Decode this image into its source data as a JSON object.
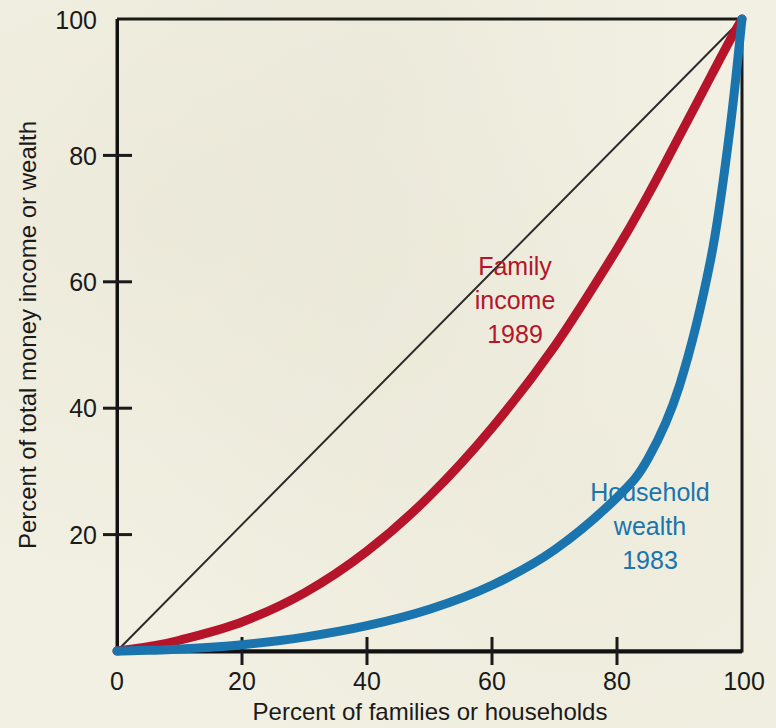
{
  "page": {
    "background_color": "#f2f0e2",
    "ink_color": "#1a1a1a"
  },
  "chart_data": {
    "type": "line",
    "title": "",
    "xlabel": "Percent of families or households",
    "ylabel": "Percent of total money income or wealth",
    "xlim": [
      0,
      100
    ],
    "ylim": [
      0,
      100
    ],
    "grid": false,
    "legend": "inline-annotations",
    "xticks": [
      "0",
      "20",
      "40",
      "60",
      "80",
      "100"
    ],
    "yticks": [
      "0",
      "20",
      "40",
      "60",
      "80",
      "100"
    ],
    "xtick_values": [
      0,
      20,
      40,
      60,
      80,
      100
    ],
    "ytick_values": [
      0,
      20,
      40,
      60,
      80,
      100
    ],
    "series": [
      {
        "name": "Line of perfect equality",
        "color": "#2b2b2b",
        "width": 2,
        "x": [
          0,
          100
        ],
        "values": [
          0,
          100
        ]
      },
      {
        "name": "Family income 1989",
        "color": "#b5142a",
        "width": 9,
        "x": [
          0,
          5,
          10,
          20,
          30,
          40,
          50,
          60,
          70,
          80,
          85,
          90,
          95,
          98,
          100
        ],
        "values": [
          0,
          0.7,
          1.7,
          4.6,
          9.2,
          15.8,
          24.5,
          35.3,
          48.2,
          63.6,
          72.2,
          81.5,
          90.9,
          96.5,
          100
        ]
      },
      {
        "name": "Household wealth 1983",
        "color": "#1a74ae",
        "width": 9,
        "x": [
          0,
          5,
          10,
          20,
          30,
          40,
          50,
          60,
          70,
          80,
          85,
          90,
          95,
          98,
          100
        ],
        "values": [
          0,
          0.1,
          0.3,
          1.0,
          2.2,
          4.0,
          6.6,
          10.4,
          16.0,
          24.3,
          30.5,
          42.0,
          62.0,
          82.0,
          100
        ]
      }
    ],
    "annotations": [
      {
        "id": "family-income-label",
        "color": "#b5142a",
        "lines": [
          "Family",
          "income",
          "1989"
        ],
        "x_px": 515,
        "y_px": 275
      },
      {
        "id": "household-wealth-label",
        "color": "#1a74ae",
        "lines": [
          "Household",
          "wealth",
          "1983"
        ],
        "x_px": 650,
        "y_px": 501
      }
    ]
  },
  "axes": {
    "x_title": "Percent of families or households",
    "y_title": "Percent of total money income or wealth",
    "x_tick_labels": [
      "0",
      "20",
      "40",
      "60",
      "80",
      "100"
    ],
    "y_tick_labels": [
      "0",
      "20",
      "40",
      "60",
      "80",
      "100"
    ]
  },
  "annotations": {
    "family": {
      "line1": "Family",
      "line2": "income",
      "line3": "1989",
      "color": "#b5142a"
    },
    "household": {
      "line1": "Household",
      "line2": "wealth",
      "line3": "1983",
      "color": "#1a74ae"
    }
  }
}
